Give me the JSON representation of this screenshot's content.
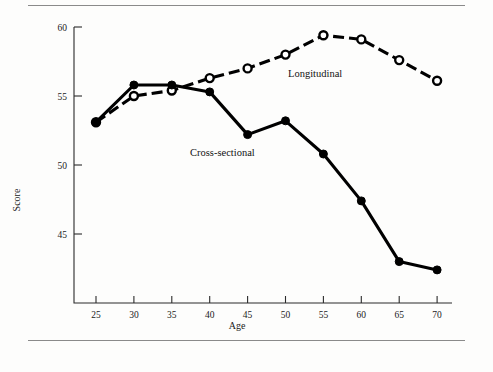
{
  "figure": {
    "background_color": "#fdfdfc",
    "rule_color": "#8a8a8a",
    "ink_color": "#000000"
  },
  "axes": {
    "x_title": "Age",
    "y_title": "Score",
    "x_ticks": [
      "25",
      "30",
      "35",
      "40",
      "45",
      "50",
      "55",
      "60",
      "65",
      "70"
    ],
    "y_ticks": [
      "45",
      "50",
      "55",
      "60"
    ]
  },
  "annotations": {
    "longitudinal_label": "Longitudinal",
    "cross_sectional_label": "Cross-sectional"
  },
  "chart_data": {
    "type": "line",
    "title": "",
    "xlabel": "Age",
    "ylabel": "Score",
    "xlim": [
      22.5,
      72.5
    ],
    "ylim": [
      41,
      60.8
    ],
    "x": [
      25,
      30,
      35,
      40,
      45,
      50,
      55,
      60,
      65,
      70
    ],
    "grid": false,
    "legend": "inline-annotations",
    "series": [
      {
        "name": "Longitudinal",
        "marker": "open-circle",
        "line_style": "dashed",
        "values": [
          53.1,
          55.0,
          55.4,
          56.3,
          57.0,
          58.0,
          59.4,
          59.1,
          57.6,
          56.1
        ]
      },
      {
        "name": "Cross-sectional",
        "marker": "filled-circle",
        "line_style": "solid",
        "values": [
          53.1,
          55.8,
          55.8,
          55.3,
          52.2,
          53.2,
          50.8,
          47.4,
          43.0,
          42.4
        ]
      }
    ]
  }
}
